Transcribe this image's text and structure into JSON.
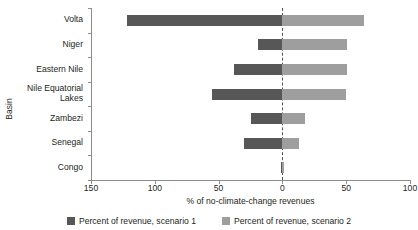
{
  "chart_data": {
    "type": "bar",
    "orientation": "horizontal",
    "title": "",
    "xlabel": "% of no-climate-change revenues",
    "ylabel": "Basin",
    "xlim": [
      -150,
      100
    ],
    "xticks": [
      -150,
      -100,
      -50,
      0,
      50,
      100
    ],
    "xtick_labels": [
      "150",
      "100",
      "50",
      "0",
      "50",
      "100"
    ],
    "grid": false,
    "zero_reference_line": true,
    "legend_position": "bottom",
    "categories": [
      "Volta",
      "Niger",
      "Eastern Nile",
      "Nile Equatorial\nLakes",
      "Zambezi",
      "Senegal",
      "Congo"
    ],
    "series": [
      {
        "name": "Percent of revenue",
        "key": "negative",
        "color": "#575757",
        "values": [
          -122,
          -19,
          -38,
          -55,
          -25,
          -30,
          -1
        ]
      },
      {
        "name": "Percent of revenue",
        "key": "positive",
        "color": "#9e9e9e",
        "values": [
          64,
          51,
          51,
          50,
          18,
          13,
          1
        ]
      }
    ]
  },
  "axis": {
    "y_title": "Basin",
    "x_title": "% of no-climate-change revenues"
  },
  "legend": {
    "items": [
      {
        "label": "Percent of revenue, scenario 1",
        "color": "#575757"
      },
      {
        "label": "Percent of revenue, scenario 2",
        "color": "#9e9e9e"
      }
    ]
  },
  "colors": {
    "negative_bar": "#575757",
    "positive_bar": "#9e9e9e",
    "axis": "#8c8c8c",
    "text": "#231f20",
    "zero_line": "#555555"
  }
}
